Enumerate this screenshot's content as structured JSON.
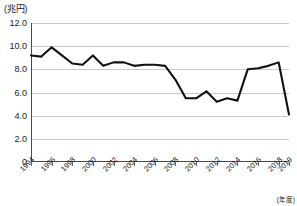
{
  "chart_data": {
    "type": "line",
    "title": "",
    "subtitle": "",
    "ylabel": "(兆円)",
    "xlabel": "(年度)",
    "ylim": [
      0,
      12.0
    ],
    "yticks": [
      "0",
      "2.0",
      "4.0",
      "6.0",
      "8.0",
      "10.0",
      "12.0"
    ],
    "ytick_values": [
      0,
      2.0,
      4.0,
      6.0,
      8.0,
      10.0,
      12.0
    ],
    "grid": true,
    "legend": "none",
    "x": [
      1994,
      1995,
      1996,
      1997,
      1998,
      1999,
      2000,
      2001,
      2002,
      2003,
      2004,
      2005,
      2006,
      2007,
      2008,
      2009,
      2010,
      2011,
      2012,
      2013,
      2014,
      2015,
      2016,
      2017,
      2018,
      2019
    ],
    "xtick_labels": [
      "1994",
      "1996",
      "1998",
      "2000",
      "2002",
      "2004",
      "2006",
      "2008",
      "2010",
      "2012",
      "2014",
      "2016",
      "2018",
      "2019"
    ],
    "xtick_values": [
      1994,
      1996,
      1998,
      2000,
      2002,
      2004,
      2006,
      2008,
      2010,
      2012,
      2014,
      2016,
      2018,
      2019
    ],
    "series": [
      {
        "name": "",
        "values": [
          9.2,
          9.1,
          9.9,
          9.2,
          8.5,
          8.4,
          9.2,
          8.3,
          8.6,
          8.6,
          8.3,
          8.4,
          8.4,
          8.3,
          7.1,
          5.5,
          5.5,
          6.1,
          5.2,
          5.5,
          5.3,
          8.0,
          8.1,
          8.3,
          8.6,
          4.1
        ]
      }
    ]
  },
  "axis": {
    "unit_label": "(兆円)",
    "x_unit_label": "(年度)"
  }
}
